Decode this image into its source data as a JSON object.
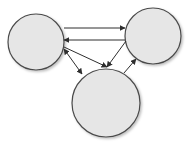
{
  "diagram": {
    "type": "directed-graph",
    "colors": {
      "node_fill": "#e6e6e6",
      "node_stroke": "#4a4a4a",
      "edge": "#2e2e2e",
      "background": "#ffffff"
    },
    "nodes": [
      {
        "id": "A",
        "position": "left",
        "cx": 36,
        "cy": 42,
        "r": 28,
        "label": ""
      },
      {
        "id": "B",
        "position": "right",
        "cx": 153,
        "cy": 36,
        "r": 28,
        "label": ""
      },
      {
        "id": "C",
        "position": "bottom",
        "cx": 106,
        "cy": 103,
        "r": 34,
        "label": ""
      }
    ],
    "edges": [
      {
        "from": "A",
        "to": "B",
        "x1": 64,
        "y1": 28,
        "x2": 125,
        "y2": 28,
        "start_arrow": false,
        "end_arrow": true
      },
      {
        "from": "B",
        "to": "A",
        "x1": 125,
        "y1": 40,
        "x2": 64,
        "y2": 40,
        "start_arrow": false,
        "end_arrow": true
      },
      {
        "from": "A",
        "to": "C",
        "x1": 64,
        "y1": 49,
        "x2": 82,
        "y2": 74,
        "start_arrow": true,
        "end_arrow": true
      },
      {
        "from": "A",
        "to": "C",
        "x1": 64,
        "y1": 47,
        "x2": 107,
        "y2": 67,
        "start_arrow": false,
        "end_arrow": true
      },
      {
        "from": "B",
        "to": "C",
        "x1": 126,
        "y1": 41,
        "x2": 107,
        "y2": 67,
        "start_arrow": false,
        "end_arrow": true
      },
      {
        "from": "C",
        "to": "B",
        "x1": 124,
        "y1": 73,
        "x2": 136,
        "y2": 59,
        "start_arrow": false,
        "end_arrow": true
      }
    ]
  }
}
